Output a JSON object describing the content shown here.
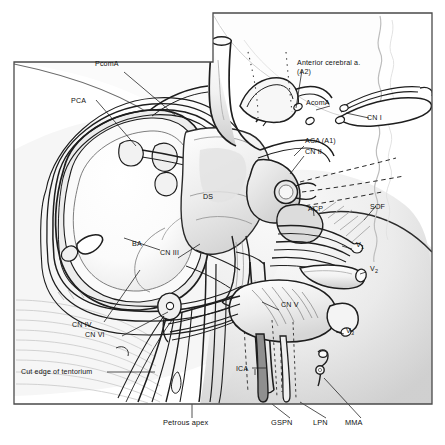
{
  "figure": {
    "kind": "anatomical-line-illustration",
    "width": 445,
    "height": 445,
    "background_color": "#ffffff",
    "ink_color": "#1a1a1a",
    "shade_light": "#e9e9e9",
    "shade_mid": "#d2d2d2",
    "shade_dark": "#b4b4b4",
    "frame": {
      "stroke_color": "#4a4a4a",
      "note": "stepped rectangular border; low on left, stepped up at right of center"
    }
  },
  "labels": [
    {
      "id": "pcoma",
      "text": "PcomA",
      "x": 111,
      "y": 66,
      "anchor": "middle"
    },
    {
      "id": "pca",
      "text": "PCA",
      "x": 84,
      "y": 103,
      "anchor": "middle"
    },
    {
      "id": "aca2",
      "text": "Anterior cerebral a.",
      "x": 297,
      "y": 65,
      "anchor": "start"
    },
    {
      "id": "aca2b",
      "text": "(A2)",
      "x": 297,
      "y": 74,
      "anchor": "start"
    },
    {
      "id": "acoma",
      "text": "AcomA",
      "x": 306,
      "y": 105,
      "anchor": "start"
    },
    {
      "id": "cn1",
      "text": "CN I",
      "x": 367,
      "y": 120,
      "anchor": "start"
    },
    {
      "id": "aca1",
      "text": "ACA (A1)",
      "x": 305,
      "y": 143,
      "anchor": "start"
    },
    {
      "id": "cn2",
      "text": "CN II",
      "x": 305,
      "y": 154,
      "anchor": "start"
    },
    {
      "id": "ds",
      "text": "DS",
      "x": 211,
      "y": 199,
      "anchor": "middle"
    },
    {
      "id": "acp",
      "text": "ACP",
      "x": 308,
      "y": 211,
      "anchor": "start"
    },
    {
      "id": "sof",
      "text": "SOF",
      "x": 370,
      "y": 209,
      "anchor": "start"
    },
    {
      "id": "ba",
      "text": "BA",
      "x": 139,
      "y": 246,
      "anchor": "middle"
    },
    {
      "id": "cn3",
      "text": "CN III",
      "x": 173,
      "y": 255,
      "anchor": "middle"
    },
    {
      "id": "v1",
      "text": "V",
      "sub": "1",
      "x": 356,
      "y": 247,
      "anchor": "start"
    },
    {
      "id": "v2",
      "text": "V",
      "sub": "2",
      "x": 370,
      "y": 271,
      "anchor": "start"
    },
    {
      "id": "cnv",
      "text": "CN V",
      "x": 281,
      "y": 307,
      "anchor": "start"
    },
    {
      "id": "v3",
      "text": "V",
      "sub": "3",
      "x": 346,
      "y": 333,
      "anchor": "start"
    },
    {
      "id": "cn4",
      "text": "CN IV",
      "x": 88,
      "y": 327,
      "anchor": "middle"
    },
    {
      "id": "cn6",
      "text": "CN VI",
      "x": 103,
      "y": 337,
      "anchor": "middle"
    },
    {
      "id": "ica",
      "text": "ICA",
      "x": 236,
      "y": 371,
      "anchor": "start"
    },
    {
      "id": "cutedge",
      "text": "Cut edge of tentorium",
      "x": 21,
      "y": 374,
      "anchor": "start"
    },
    {
      "id": "petrous",
      "text": "Petrous apex",
      "x": 192,
      "y": 425,
      "anchor": "middle"
    },
    {
      "id": "gspn",
      "text": "GSPN",
      "x": 288,
      "y": 425,
      "anchor": "middle"
    },
    {
      "id": "lpn",
      "text": "LPN",
      "x": 326,
      "y": 425,
      "anchor": "middle"
    },
    {
      "id": "mma",
      "text": "MMA",
      "x": 361,
      "y": 425,
      "anchor": "middle"
    }
  ],
  "glossary": {
    "PcomA": "posterior communicating artery",
    "PCA": "posterior cerebral artery",
    "AcomA": "anterior communicating artery",
    "ACA (A1)": "anterior cerebral artery, A1 segment",
    "Anterior cerebral a. (A2)": "anterior cerebral artery, A2 segment",
    "BA": "basilar artery",
    "ICA": "internal carotid artery",
    "DS": "dorsum sellae",
    "ACP": "anterior clinoid process",
    "SOF": "superior orbital fissure",
    "CN I": "olfactory nerve",
    "CN II": "optic nerve",
    "CN III": "oculomotor nerve",
    "CN IV": "trochlear nerve",
    "CN V": "trigeminal nerve",
    "CN VI": "abducens nerve",
    "V1": "ophthalmic division of trigeminal nerve",
    "V2": "maxillary division of trigeminal nerve",
    "V3": "mandibular division of trigeminal nerve",
    "GSPN": "greater superficial petrosal nerve",
    "LPN": "lesser petrosal nerve",
    "MMA": "middle meningeal artery"
  }
}
